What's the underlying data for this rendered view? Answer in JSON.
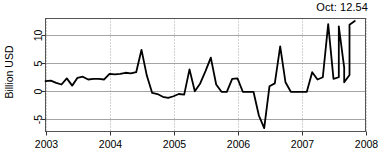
{
  "chart_data": {
    "type": "line",
    "title": "",
    "subtitle": "",
    "xlabel": "",
    "ylabel": "Billion USD",
    "annotation": "Oct: 12.54",
    "grid": true,
    "legend": false,
    "xlim": [
      2003.0,
      2008.0
    ],
    "ylim": [
      -7.2,
      13.0
    ],
    "xticks": [
      2003,
      2004,
      2005,
      2006,
      2007,
      2008
    ],
    "xtick_labels": [
      "2003",
      "2004",
      "2005",
      "2006",
      "2007",
      "2008"
    ],
    "yticks": [
      -5,
      0,
      5,
      10
    ],
    "ytick_labels": [
      "-5",
      "0",
      "5",
      "10"
    ],
    "series": [
      {
        "name": "Monthly value",
        "x": [
          2003.0,
          2003.083,
          2003.167,
          2003.25,
          2003.333,
          2003.417,
          2003.5,
          2003.583,
          2003.667,
          2003.75,
          2003.833,
          2003.917,
          2004.0,
          2004.083,
          2004.167,
          2004.25,
          2004.333,
          2004.417,
          2004.5,
          2004.583,
          2004.667,
          2004.75,
          2004.833,
          2004.917,
          2005.0,
          2005.083,
          2005.167,
          2005.25,
          2005.333,
          2005.417,
          2005.5,
          2005.583,
          2005.667,
          2005.75,
          2005.833,
          2005.917,
          2006.0,
          2006.083,
          2006.167,
          2006.25,
          2006.333,
          2006.417,
          2006.5,
          2006.583,
          2006.667,
          2006.75,
          2006.833,
          2006.917,
          2007.0,
          2007.083,
          2007.167,
          2007.25,
          2007.333,
          2007.417,
          2007.5,
          2007.583,
          2007.667,
          2007.75
        ],
        "values": [
          1.8,
          1.9,
          1.5,
          1.2,
          2.3,
          1.0,
          2.4,
          2.6,
          2.1,
          2.2,
          2.2,
          2.1,
          3.1,
          3.0,
          3.1,
          3.3,
          3.2,
          3.4,
          7.4,
          2.8,
          -0.3,
          -0.5,
          -1.0,
          -1.2,
          -0.9,
          -0.5,
          -0.6,
          3.9,
          0.0,
          1.4,
          3.6,
          6.0,
          1.2,
          -0.1,
          -0.1,
          2.2,
          2.3,
          -0.1,
          -0.1,
          -0.1,
          -4.3,
          -6.6,
          0.9,
          1.4,
          8.0,
          1.6,
          -0.1,
          -0.1,
          -0.1,
          -0.1,
          3.4,
          2.1,
          2.5,
          12.0,
          2.2,
          2.5,
          4.2,
          2.9
        ]
      }
    ],
    "extra_points": {
      "note": "final segment rises to latest reading",
      "x": [
        2007.583,
        2007.667,
        2007.75,
        2007.833
      ],
      "values": [
        11.6,
        1.6,
        11.9,
        12.54
      ]
    }
  },
  "axis": {
    "y_axis_title": "Billion USD",
    "x_axis_title": ""
  }
}
